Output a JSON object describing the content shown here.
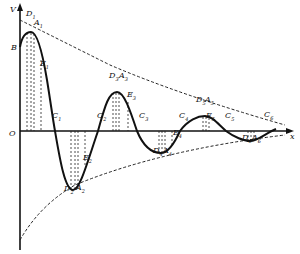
{
  "diagram": {
    "type": "damped-oscillation",
    "axes": {
      "y_label": "V",
      "x_label": "x",
      "origin_label": "O",
      "start_label": "B"
    },
    "colors": {
      "curve": "#111111",
      "envelope": "#222222",
      "background": "#ffffff"
    },
    "points": [
      {
        "id": "D1",
        "text": "D",
        "sub": "1",
        "x": 30,
        "y": 19
      },
      {
        "id": "A1",
        "text": "A",
        "sub": "1",
        "x": 38,
        "y": 28
      },
      {
        "id": "E1",
        "text": "E",
        "sub": "1",
        "x": 44,
        "y": 69
      },
      {
        "id": "C1",
        "text": "C",
        "sub": "1",
        "x": 56,
        "y": 121
      },
      {
        "id": "E2",
        "text": "E",
        "sub": "2",
        "x": 87,
        "y": 163
      },
      {
        "id": "D2",
        "text": "D",
        "sub": "2",
        "x": 68,
        "y": 194
      },
      {
        "id": "A2",
        "text": "A",
        "sub": "2",
        "x": 80,
        "y": 193
      },
      {
        "id": "C2",
        "text": "C",
        "sub": "2",
        "x": 101,
        "y": 121
      },
      {
        "id": "D3",
        "text": "D",
        "sub": "3",
        "x": 113,
        "y": 81
      },
      {
        "id": "A3",
        "text": "A",
        "sub": "3",
        "x": 123,
        "y": 81
      },
      {
        "id": "E3",
        "text": "E",
        "sub": "3",
        "x": 131,
        "y": 100
      },
      {
        "id": "C3",
        "text": "C",
        "sub": "3",
        "x": 143,
        "y": 121
      },
      {
        "id": "E4",
        "text": "E",
        "sub": "4",
        "x": 177,
        "y": 138
      },
      {
        "id": "D4",
        "text": "D",
        "sub": "4",
        "x": 157,
        "y": 156
      },
      {
        "id": "A4",
        "text": "A",
        "sub": "4",
        "x": 167,
        "y": 156
      },
      {
        "id": "C4",
        "text": "C",
        "sub": "4",
        "x": 183,
        "y": 121
      },
      {
        "id": "D5",
        "text": "D",
        "sub": "5",
        "x": 200,
        "y": 105
      },
      {
        "id": "A5",
        "text": "A",
        "sub": "5",
        "x": 209,
        "y": 105
      },
      {
        "id": "E5",
        "text": "E",
        "sub": "5",
        "x": 210,
        "y": 121
      },
      {
        "id": "C5",
        "text": "C",
        "sub": "5",
        "x": 229,
        "y": 121
      },
      {
        "id": "D6",
        "text": "D",
        "sub": "6",
        "x": 246,
        "y": 143
      },
      {
        "id": "A6",
        "text": "A",
        "sub": "6",
        "x": 256,
        "y": 143
      },
      {
        "id": "C6",
        "text": "C",
        "sub": "6",
        "x": 268,
        "y": 120
      }
    ]
  }
}
